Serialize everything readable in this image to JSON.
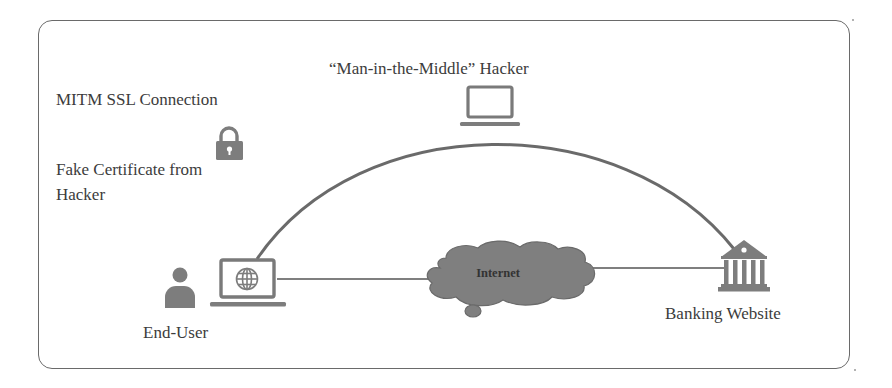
{
  "diagram": {
    "title": "“Man-in-the-Middle” Hacker",
    "connection_label": "MITM SSL Connection",
    "certificate_label_line1": "Fake Certificate from",
    "certificate_label_line2": "Hacker",
    "cloud_label": "Internet",
    "end_user_label": "End-User",
    "bank_label": "Banking Website",
    "icons": {
      "hacker": "laptop-icon",
      "lock": "lock-icon",
      "user": "user-icon",
      "end_user_device": "laptop-globe-icon",
      "internet": "cloud-icon",
      "bank": "bank-icon"
    },
    "colors": {
      "icon_fill": "#7d7d7d",
      "line": "#6e6e6e",
      "text": "#3c3c3c",
      "frame": "#6a6a6a",
      "background": "#ffffff"
    }
  }
}
